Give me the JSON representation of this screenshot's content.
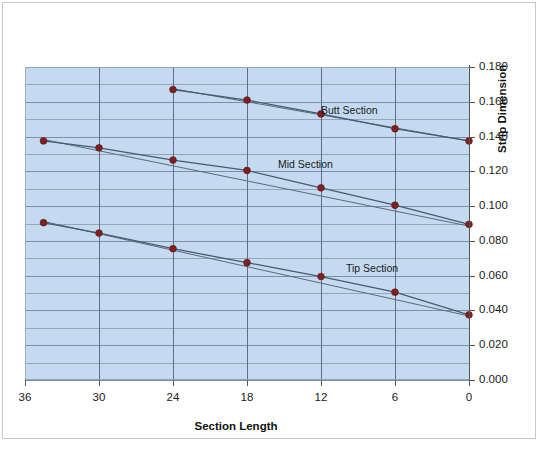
{
  "chart_data": {
    "type": "line",
    "title": "",
    "xlabel": "Section Length",
    "ylabel": "Strip Dimension",
    "xlim": [
      36,
      0
    ],
    "ylim": [
      0.0,
      0.18
    ],
    "x_ticks": [
      "36",
      "30",
      "24",
      "18",
      "12",
      "6",
      "0"
    ],
    "x_tick_values": [
      36,
      30,
      24,
      18,
      12,
      6,
      0
    ],
    "y_ticks": [
      "0.000",
      "0.020",
      "0.040",
      "0.060",
      "0.080",
      "0.100",
      "0.120",
      "0.140",
      "0.160",
      "0.180"
    ],
    "y_tick_values": [
      0.0,
      0.02,
      0.04,
      0.06,
      0.08,
      0.1,
      0.12,
      0.14,
      0.16,
      0.18
    ],
    "y_minor_step": 0.01,
    "grid": true,
    "grid_color": "#7d8fa5",
    "plot_bg_color": "#c3daf0",
    "marker_color": "#7f2020",
    "line_color": "#4a5a6e",
    "trendline_color": "#5a6a7e",
    "y_axis_position": "right",
    "x_axis_reversed": true,
    "legend": "inline-labels",
    "series": [
      {
        "name": "Butt Section",
        "label_x": 12.0,
        "label_y": 0.1555,
        "x": [
          24,
          18,
          12,
          6,
          0
        ],
        "values": [
          0.167,
          0.161,
          0.153,
          0.1445,
          0.1375
        ],
        "trendline": {
          "x": [
            24,
            0
          ],
          "values": [
            0.1675,
            0.1375
          ]
        }
      },
      {
        "name": "Mid Section",
        "label_x": 15.5,
        "label_y": 0.1245,
        "x": [
          34.5,
          30,
          24,
          18,
          12,
          6,
          0
        ],
        "values": [
          0.1375,
          0.1335,
          0.1265,
          0.1205,
          0.1105,
          0.1005,
          0.0895
        ],
        "trendline": {
          "x": [
            34.5,
            0
          ],
          "values": [
            0.1383,
            0.0885
          ]
        }
      },
      {
        "name": "Tip Section",
        "label_x": 10.0,
        "label_y": 0.0645,
        "x": [
          34.5,
          30,
          24,
          18,
          12,
          6,
          0
        ],
        "values": [
          0.0905,
          0.0845,
          0.0755,
          0.0675,
          0.0595,
          0.0505,
          0.0375
        ],
        "trendline": {
          "x": [
            34.5,
            0
          ],
          "values": [
            0.0912,
            0.0368
          ]
        }
      }
    ]
  }
}
